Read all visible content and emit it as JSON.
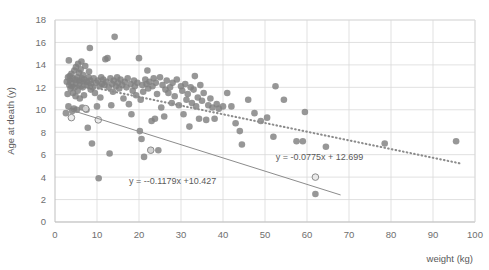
{
  "chart_data": {
    "type": "scatter",
    "title": "",
    "xlabel": "weight (kg)",
    "ylabel": "Age at death (y)",
    "xlim": [
      0,
      100
    ],
    "ylim": [
      0,
      18
    ],
    "xticks": [
      0,
      10,
      20,
      30,
      40,
      50,
      60,
      70,
      80,
      90,
      100
    ],
    "yticks": [
      0,
      2,
      4,
      6,
      8,
      10,
      12,
      14,
      16,
      18
    ],
    "grid": true,
    "legend": "none",
    "marker_color": "#808080",
    "series": [
      {
        "name": "scatter-points",
        "marker": "filled-circle",
        "points": [
          [
            2.6,
            9.7
          ],
          [
            2.8,
            12.5
          ],
          [
            3.0,
            11.4
          ],
          [
            3.1,
            12.9
          ],
          [
            3.2,
            10.3
          ],
          [
            3.3,
            14.4
          ],
          [
            3.4,
            12.2
          ],
          [
            3.5,
            13.0
          ],
          [
            3.6,
            12.6
          ],
          [
            3.7,
            11.9
          ],
          [
            3.8,
            12.4
          ],
          [
            3.9,
            13.2
          ],
          [
            4.0,
            12.1
          ],
          [
            4.1,
            9.9
          ],
          [
            4.2,
            12.8
          ],
          [
            4.3,
            11.5
          ],
          [
            4.4,
            12.3
          ],
          [
            4.5,
            10.1
          ],
          [
            4.6,
            13.5
          ],
          [
            4.7,
            12.0
          ],
          [
            4.8,
            12.7
          ],
          [
            4.9,
            11.2
          ],
          [
            5.0,
            13.8
          ],
          [
            5.1,
            12.4
          ],
          [
            5.2,
            10.0
          ],
          [
            5.3,
            12.9
          ],
          [
            5.4,
            11.7
          ],
          [
            5.5,
            14.1
          ],
          [
            5.6,
            12.2
          ],
          [
            5.7,
            13.3
          ],
          [
            5.8,
            12.6
          ],
          [
            5.9,
            11.0
          ],
          [
            6.0,
            12.5
          ],
          [
            6.1,
            13.6
          ],
          [
            6.2,
            12.1
          ],
          [
            6.3,
            14.3
          ],
          [
            6.4,
            12.8
          ],
          [
            6.5,
            10.2
          ],
          [
            6.6,
            12.0
          ],
          [
            6.7,
            13.1
          ],
          [
            6.8,
            12.4
          ],
          [
            6.9,
            11.3
          ],
          [
            7.0,
            12.7
          ],
          [
            7.2,
            13.9
          ],
          [
            7.4,
            12.2
          ],
          [
            7.5,
            10.0
          ],
          [
            7.6,
            12.5
          ],
          [
            7.8,
            8.4
          ],
          [
            8.0,
            12.9
          ],
          [
            8.1,
            13.4
          ],
          [
            8.2,
            12.1
          ],
          [
            8.3,
            15.5
          ],
          [
            8.4,
            12.6
          ],
          [
            8.5,
            11.8
          ],
          [
            8.6,
            12.3
          ],
          [
            8.8,
            7.0
          ],
          [
            9.0,
            12.0
          ],
          [
            9.2,
            12.8
          ],
          [
            9.5,
            11.5
          ],
          [
            9.8,
            12.4
          ],
          [
            10.0,
            10.3
          ],
          [
            10.2,
            12.6
          ],
          [
            10.4,
            3.9
          ],
          [
            10.6,
            12.1
          ],
          [
            10.8,
            11.1
          ],
          [
            11.0,
            12.9
          ],
          [
            11.2,
            12.3
          ],
          [
            11.5,
            12.7
          ],
          [
            11.8,
            12.2
          ],
          [
            12.0,
            14.5
          ],
          [
            12.2,
            12.5
          ],
          [
            12.5,
            14.6
          ],
          [
            12.8,
            12.0
          ],
          [
            13.0,
            6.1
          ],
          [
            13.2,
            12.8
          ],
          [
            13.4,
            10.4
          ],
          [
            13.6,
            12.3
          ],
          [
            13.8,
            11.6
          ],
          [
            14.0,
            12.6
          ],
          [
            14.2,
            16.5
          ],
          [
            14.5,
            12.1
          ],
          [
            14.8,
            12.9
          ],
          [
            15.0,
            12.4
          ],
          [
            15.3,
            11.9
          ],
          [
            15.6,
            12.7
          ],
          [
            16.0,
            12.2
          ],
          [
            16.3,
            11.0
          ],
          [
            16.6,
            12.5
          ],
          [
            17.0,
            12.0
          ],
          [
            17.3,
            12.8
          ],
          [
            17.6,
            10.5
          ],
          [
            18.0,
            12.3
          ],
          [
            18.2,
            9.6
          ],
          [
            18.5,
            11.7
          ],
          [
            18.8,
            12.6
          ],
          [
            19.0,
            12.1
          ],
          [
            19.3,
            11.3
          ],
          [
            19.6,
            12.4
          ],
          [
            20.0,
            14.6
          ],
          [
            20.2,
            8.1
          ],
          [
            20.4,
            10.9
          ],
          [
            20.6,
            7.4
          ],
          [
            20.8,
            12.2
          ],
          [
            21.0,
            11.6
          ],
          [
            21.2,
            5.8
          ],
          [
            21.5,
            12.7
          ],
          [
            21.8,
            12.3
          ],
          [
            22.0,
            13.5
          ],
          [
            22.2,
            11.9
          ],
          [
            22.5,
            12.5
          ],
          [
            22.8,
            6.4
          ],
          [
            23.0,
            9.0
          ],
          [
            23.2,
            12.1
          ],
          [
            23.5,
            12.8
          ],
          [
            23.8,
            9.2
          ],
          [
            24.0,
            12.4
          ],
          [
            24.3,
            11.4
          ],
          [
            24.6,
            6.4
          ],
          [
            25.0,
            12.9
          ],
          [
            25.3,
            10.2
          ],
          [
            25.6,
            12.2
          ],
          [
            26.0,
            9.4
          ],
          [
            26.3,
            11.8
          ],
          [
            26.6,
            12.6
          ],
          [
            27.0,
            11.5
          ],
          [
            27.4,
            12.0
          ],
          [
            27.8,
            10.6
          ],
          [
            28.0,
            12.4
          ],
          [
            28.5,
            11.2
          ],
          [
            29.0,
            12.7
          ],
          [
            29.5,
            10.4
          ],
          [
            30.0,
            12.1
          ],
          [
            30.3,
            11.7
          ],
          [
            30.6,
            9.6
          ],
          [
            31.0,
            12.3
          ],
          [
            31.3,
            10.9
          ],
          [
            31.6,
            11.4
          ],
          [
            32.0,
            8.5
          ],
          [
            32.3,
            12.0
          ],
          [
            32.6,
            10.6
          ],
          [
            33.0,
            11.8
          ],
          [
            33.3,
            13.0
          ],
          [
            33.6,
            10.3
          ],
          [
            34.0,
            11.1
          ],
          [
            34.3,
            9.2
          ],
          [
            34.6,
            12.2
          ],
          [
            35.0,
            10.8
          ],
          [
            35.4,
            11.5
          ],
          [
            36.0,
            9.1
          ],
          [
            36.5,
            10.4
          ],
          [
            37.0,
            11.0
          ],
          [
            37.5,
            10.2
          ],
          [
            38.0,
            9.2
          ],
          [
            38.5,
            10.5
          ],
          [
            39.0,
            10.1
          ],
          [
            40.0,
            10.3
          ],
          [
            41.0,
            11.5
          ],
          [
            42.0,
            10.3
          ],
          [
            43.0,
            8.8
          ],
          [
            44.0,
            8.1
          ],
          [
            44.5,
            6.9
          ],
          [
            46.0,
            10.9
          ],
          [
            47.5,
            9.7
          ],
          [
            49.0,
            9.0
          ],
          [
            50.5,
            9.3
          ],
          [
            52.0,
            7.6
          ],
          [
            52.5,
            12.1
          ],
          [
            54.5,
            10.9
          ],
          [
            57.5,
            7.2
          ],
          [
            59.0,
            7.2
          ],
          [
            59.5,
            9.8
          ],
          [
            62.0,
            2.5
          ],
          [
            64.5,
            6.7
          ],
          [
            78.5,
            7.0
          ],
          [
            95.5,
            7.2
          ]
        ]
      },
      {
        "name": "highlighted-points",
        "marker": "open-circle",
        "points": [
          [
            3.9,
            9.3
          ],
          [
            7.3,
            10.1
          ],
          [
            10.3,
            9.1
          ],
          [
            22.8,
            6.4
          ],
          [
            62.0,
            4.0
          ]
        ]
      }
    ],
    "trendlines": [
      {
        "name": "solid-trendline",
        "style": "solid",
        "equation": "y = --0.1179x +10.427",
        "slope": -0.1179,
        "intercept": 10.427,
        "x_start": 3,
        "x_end": 68,
        "label_x": 28,
        "label_y": 3.35
      },
      {
        "name": "dotted-trendline",
        "style": "dotted",
        "equation": "y = -0.0775x + 12.699",
        "slope": -0.0775,
        "intercept": 12.699,
        "x_start": 4,
        "x_end": 97,
        "label_x": 63,
        "label_y": 5.55
      }
    ]
  }
}
